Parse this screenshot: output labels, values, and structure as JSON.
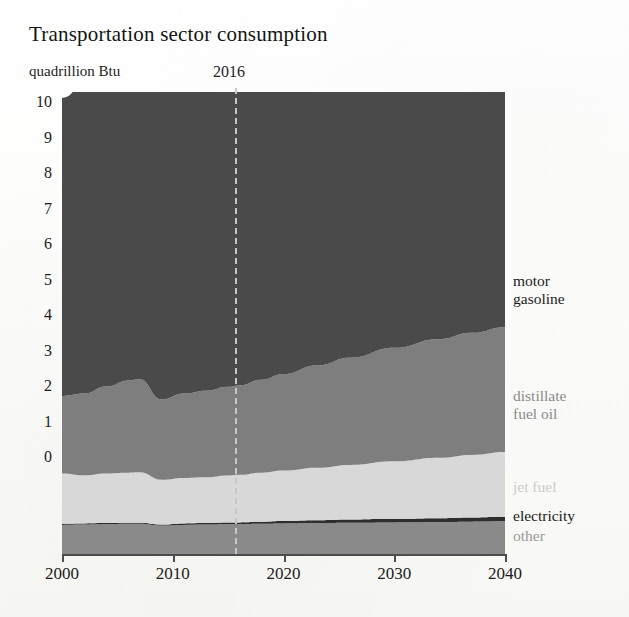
{
  "chart_data": {
    "type": "area",
    "stacked": true,
    "title": "Transportation sector consumption",
    "subtitle": "quadrillion Btu",
    "ylabel": "quadrillion Btu",
    "xlabel": "",
    "grid": false,
    "legend_position": "right-inline",
    "xlim": [
      2000,
      2040
    ],
    "ylim": [
      0,
      10
    ],
    "ytick_labels": [
      "10",
      "9",
      "8",
      "7",
      "6",
      "5",
      "4",
      "3",
      "2",
      "1",
      "0"
    ],
    "ytick_values": [
      10,
      9,
      8,
      7,
      6,
      5,
      4,
      3,
      2,
      1,
      0
    ],
    "xtick_labels": [
      "2000",
      "2010",
      "2020",
      "2030",
      "2040"
    ],
    "xtick_values": [
      2000,
      2010,
      2020,
      2030,
      2040
    ],
    "annotations": [
      {
        "name": "divider-year",
        "text": "2016",
        "x": 2016
      },
      {
        "name": "history-region",
        "text": "History"
      },
      {
        "name": "projections-region",
        "text": "Projections"
      }
    ],
    "x": [
      2000,
      2002,
      2004,
      2006,
      2007,
      2009,
      2011,
      2013,
      2015,
      2016,
      2018,
      2020,
      2023,
      2026,
      2030,
      2034,
      2037,
      2040
    ],
    "series": [
      {
        "name": "other",
        "label": "other",
        "color": "#8a8a8a",
        "values": [
          0.82,
          0.83,
          0.84,
          0.85,
          0.85,
          0.8,
          0.82,
          0.83,
          0.84,
          0.84,
          0.85,
          0.86,
          0.87,
          0.88,
          0.89,
          0.9,
          0.91,
          0.92
        ]
      },
      {
        "name": "electricity",
        "label": "electricity",
        "color": "#2e2e2e",
        "values": [
          0.03,
          0.03,
          0.03,
          0.03,
          0.03,
          0.03,
          0.04,
          0.04,
          0.05,
          0.05,
          0.06,
          0.07,
          0.08,
          0.09,
          0.1,
          0.11,
          0.12,
          0.13
        ]
      },
      {
        "name": "jet-fuel",
        "label": "jet fuel",
        "color": "#d8d8d8",
        "values": [
          1.42,
          1.36,
          1.4,
          1.41,
          1.42,
          1.26,
          1.28,
          1.29,
          1.32,
          1.34,
          1.38,
          1.42,
          1.48,
          1.54,
          1.62,
          1.7,
          1.76,
          1.82
        ]
      },
      {
        "name": "distillate-fuel-oil",
        "label": "distillate fuel oil",
        "color": "#7e7e7e",
        "values": [
          2.18,
          2.3,
          2.45,
          2.6,
          2.62,
          2.26,
          2.38,
          2.44,
          2.5,
          2.52,
          2.62,
          2.72,
          2.88,
          3.02,
          3.2,
          3.34,
          3.44,
          3.52
        ]
      },
      {
        "name": "motor-gasoline",
        "label": "motor gasoline",
        "color": "#4a4a4a",
        "values": [
          8.4,
          8.68,
          8.9,
          9.22,
          9.28,
          8.8,
          8.72,
          8.78,
          9.0,
          9.14,
          9.4,
          9.36,
          9.1,
          8.78,
          8.4,
          8.24,
          8.22,
          8.26
        ]
      }
    ]
  },
  "title": "Transportation sector consumption",
  "axis_unit": "quadrillion Btu",
  "marker_year": "2016",
  "history_label": "History",
  "projections_label": "Projections",
  "series_labels": {
    "motor_line1": "motor",
    "motor_line2": "gasoline",
    "distillate_line1": "distillate",
    "distillate_line2": "fuel oil",
    "jet": "jet fuel",
    "electricity": "electricity",
    "other": "other"
  },
  "y_labels": [
    "10",
    "9",
    "8",
    "7",
    "6",
    "5",
    "4",
    "3",
    "2",
    "1",
    "0"
  ],
  "x_labels": [
    "2000",
    "2010",
    "2020",
    "2030",
    "2040"
  ],
  "colors": {
    "motor_gasoline": "#4a4a4a",
    "distillate_fuel_oil": "#7e7e7e",
    "jet_fuel": "#d8d8d8",
    "electricity": "#2e2e2e",
    "other": "#8a8a8a",
    "axis": "#4d4d4d",
    "divider": "#c7c7c7"
  }
}
